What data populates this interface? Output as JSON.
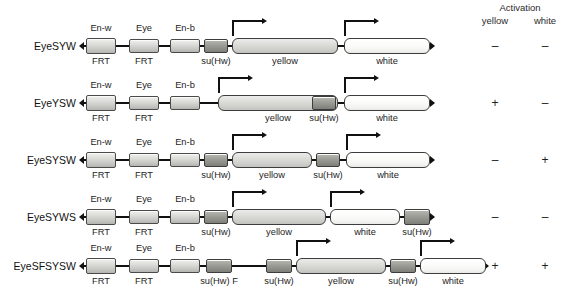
{
  "figure": {
    "header": {
      "activation_label": "Activation",
      "col_yellow": "yellow",
      "col_white": "white"
    },
    "element_labels": {
      "en_w": "En-w",
      "eye": "Eye",
      "en_b": "En-b",
      "frt": "FRT",
      "su_hw": "su(Hw)",
      "su_hw_f": "su(Hw) F",
      "yellow": "yellow",
      "white": "white"
    },
    "rows": [
      {
        "name": "EyeSYW",
        "activation_yellow": "–",
        "activation_white": "–",
        "top_labels": [
          "En-w",
          "Eye",
          "En-b"
        ],
        "bottom_labels": [
          "FRT",
          "FRT",
          "su(Hw)",
          "yellow",
          "white"
        ]
      },
      {
        "name": "EyeYSW",
        "activation_yellow": "+",
        "activation_white": "–",
        "top_labels": [
          "En-w",
          "Eye",
          "En-b"
        ],
        "bottom_labels": [
          "FRT",
          "FRT",
          "yellow",
          "su(Hw)",
          "white"
        ]
      },
      {
        "name": "EyeSYSW",
        "activation_yellow": "–",
        "activation_white": "+",
        "top_labels": [
          "En-w",
          "Eye",
          "En-b"
        ],
        "bottom_labels": [
          "FRT",
          "FRT",
          "su(Hw)",
          "yellow",
          "su(Hw)",
          "white"
        ]
      },
      {
        "name": "EyeSYWS",
        "activation_yellow": "–",
        "activation_white": "–",
        "top_labels": [
          "En-w",
          "Eye",
          "En-b"
        ],
        "bottom_labels": [
          "FRT",
          "FRT",
          "su(Hw)",
          "yellow",
          "white",
          "su(Hw)"
        ]
      },
      {
        "name": "EyeSFSYSW",
        "activation_yellow": "+",
        "activation_white": "+",
        "top_labels": [
          "En-w",
          "Eye",
          "En-b"
        ],
        "bottom_labels": [
          "FRT",
          "FRT",
          "su(Hw) F",
          "su(Hw)",
          "yellow",
          "su(Hw)",
          "white"
        ]
      }
    ],
    "colors": {
      "line": "#111111",
      "box_light": "#d8d8d4",
      "box_dark": "#9d9d98",
      "gene_yellow": "#dcdcd9",
      "gene_white": "#fbfbfa",
      "text": "#1a1a1a"
    }
  }
}
